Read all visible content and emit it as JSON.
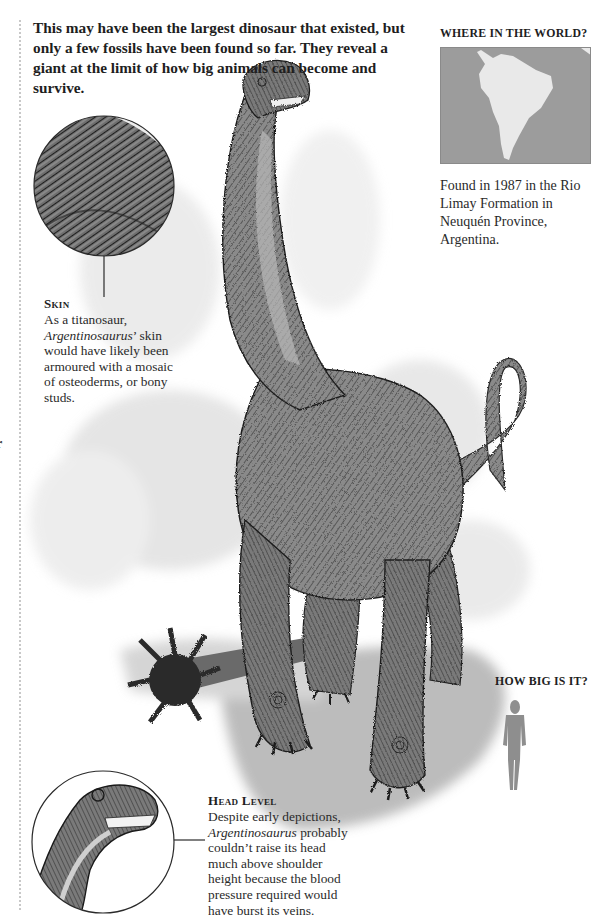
{
  "intro": {
    "text": "This may have been the largest dinosaur that existed, but only a few fossils have been found so far. They reveal a giant at the limit of how big animals can become and survive."
  },
  "edge_fragment": "r",
  "where_in_world": {
    "heading": "WHERE IN THE WORLD?",
    "map_region": "South America",
    "colors": {
      "ocean": "#9c9c9c",
      "land": "#e9e9e9"
    },
    "caption": "Found in 1987 in the Rio Limay Formation in Neuquén Province, Argentina."
  },
  "skin_callout": {
    "title": "Skin",
    "body_pre": "As a titanosaur, ",
    "body_italic": "Argentinosaurus",
    "body_post": "’ skin would have likely been armoured with a mosaic of osteoderms, or bony studs.",
    "image": "skin-texture-closeup"
  },
  "head_callout": {
    "title": "Head Level",
    "body_pre": "Despite early depictions, ",
    "body_italic": "Argentinosaurus",
    "body_post": " probably couldn’t raise its head much above shoulder height because the blood pressure required would have burst its veins.",
    "image": "head-closeup"
  },
  "how_big": {
    "heading": "HOW BIG IS IT?",
    "scale_figure": "human-silhouette"
  },
  "illustration": {
    "subject": "Argentinosaurus",
    "palette": {
      "ink": "#3a3a3a",
      "mid": "#7d7d7d",
      "wash": "#d6d6d6",
      "shadow": "#a8a8a8"
    }
  }
}
